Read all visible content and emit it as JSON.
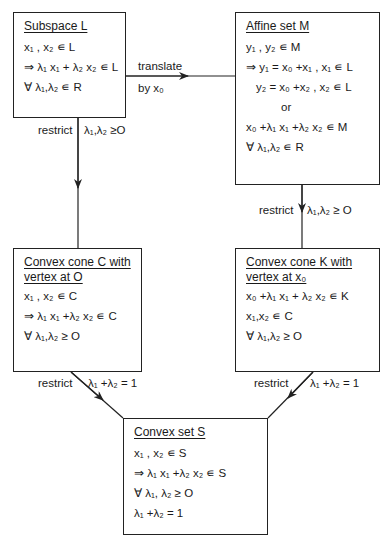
{
  "boxes": {
    "subspace": {
      "title": "Subspace L",
      "lines": [
        "x₁ , x₂  ∊ L",
        "⇒ λ₁ x₁ + λ₂ x₂ ∊ L",
        "∀ λ₁,λ₂ ∊ R"
      ]
    },
    "affine": {
      "title": "Affine set M",
      "lines": [
        "y₁ , y₂  ∊ M",
        "⇒ y₁ = x₀ +x₁ , x₁ ∊ L",
        "y₂ = x₀ +x₂ , x₂ ∊ L",
        "or",
        "x₀ +λ₁ x₁ +λ₂ x₂ ∊ M",
        "∀ λ₁,λ₂ ∊ R"
      ]
    },
    "cone_c": {
      "title": "Convex cone C with vertex at O",
      "title_lines": [
        "Convex cone C with",
        "vertex at O"
      ],
      "lines": [
        "x₁ , x₂  ∊ C",
        "⇒ λ₁ x₁ +λ₂ x₂ ∊ C",
        "∀ λ₁,λ₂ ≥ O"
      ]
    },
    "cone_k": {
      "title": "Convex cone K with vertex at x₀",
      "title_lines": [
        "Convex cone K with",
        "vertex at x₀"
      ],
      "lines": [
        "x₀ +λ₁ x₁ + λ₂ x₂ ∊ K",
        "x₁,x₂ ∊ C",
        "∀ λ₁,λ₂ ≥ O"
      ]
    },
    "convex_set": {
      "title": "Convex set S",
      "lines": [
        "x₁ , x₂ ∊ S",
        "⇒ λ₁ x₁ +λ₂ x₂ ∊ S",
        "∀ λ₁, λ₂ ≥ O",
        "λ₁ +λ₂ = 1"
      ]
    }
  },
  "edges": {
    "l_to_m": {
      "above": "translate",
      "below": "by x₀"
    },
    "l_to_c": {
      "left": "restrict",
      "right": "λ₁,λ₂ ≥O"
    },
    "m_to_k": {
      "left": "restrict",
      "right": "λ₁,λ₂ ≥ O"
    },
    "c_to_s": {
      "left": "restrict",
      "right": "λ₁ +λ₂ = 1"
    },
    "k_to_s": {
      "left": "restrict",
      "right": "λ₁ +λ₂ = 1"
    }
  }
}
